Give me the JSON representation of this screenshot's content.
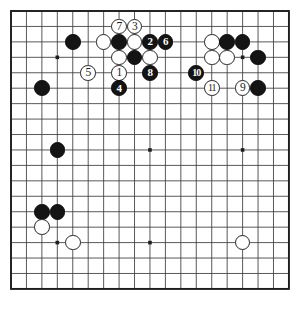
{
  "diagram": {
    "type": "go-board-diagram",
    "board_size": 19,
    "colors": {
      "background": "#ffffff",
      "grid_line": "#3c3c3c",
      "border_line": "#1e1e1e",
      "black_stone": "#141414",
      "white_stone": "#ffffff",
      "white_stone_outline": "#262626",
      "star_point": "#1e1e1e"
    },
    "geometry": {
      "origin_x": 11,
      "origin_y": 11,
      "spacing": 15.44,
      "stone_diameter": 15.6
    },
    "star_points": [
      {
        "col": 3,
        "row": 3
      },
      {
        "col": 9,
        "row": 3
      },
      {
        "col": 15,
        "row": 3
      },
      {
        "col": 3,
        "row": 9
      },
      {
        "col": 9,
        "row": 9
      },
      {
        "col": 15,
        "row": 9
      },
      {
        "col": 3,
        "row": 15
      },
      {
        "col": 9,
        "row": 15
      },
      {
        "col": 15,
        "row": 15
      }
    ],
    "stones": [
      {
        "id": "b-pre-1",
        "color": "black",
        "label": "",
        "col": 4,
        "row": 2
      },
      {
        "id": "w-pre-1",
        "color": "white",
        "label": "",
        "col": 6,
        "row": 2
      },
      {
        "id": "b-pre-2",
        "color": "black",
        "label": "",
        "col": 7,
        "row": 2
      },
      {
        "id": "w-pre-2",
        "color": "white",
        "label": "",
        "col": 8,
        "row": 2
      },
      {
        "id": "w-pre-3",
        "color": "white",
        "label": "",
        "col": 7,
        "row": 3
      },
      {
        "id": "b-pre-3",
        "color": "black",
        "label": "",
        "col": 8,
        "row": 3
      },
      {
        "id": "w-pre-4",
        "color": "white",
        "label": "",
        "col": 9,
        "row": 3
      },
      {
        "id": "b-pre-4",
        "color": "black",
        "label": "",
        "col": 2,
        "row": 5
      },
      {
        "id": "w-pre-5",
        "color": "white",
        "label": "",
        "col": 13,
        "row": 2
      },
      {
        "id": "b-pre-5",
        "color": "black",
        "label": "",
        "col": 14,
        "row": 2
      },
      {
        "id": "b-pre-6",
        "color": "black",
        "label": "",
        "col": 15,
        "row": 2
      },
      {
        "id": "w-pre-6",
        "color": "white",
        "label": "",
        "col": 13,
        "row": 3
      },
      {
        "id": "w-pre-7",
        "color": "white",
        "label": "",
        "col": 14,
        "row": 3
      },
      {
        "id": "b-pre-7",
        "color": "black",
        "label": "",
        "col": 16,
        "row": 3
      },
      {
        "id": "b-pre-8",
        "color": "black",
        "label": "",
        "col": 16,
        "row": 5
      },
      {
        "id": "b-pre-9",
        "color": "black",
        "label": "",
        "col": 3,
        "row": 9
      },
      {
        "id": "b-pre-10",
        "color": "black",
        "label": "",
        "col": 2,
        "row": 13
      },
      {
        "id": "b-pre-11",
        "color": "black",
        "label": "",
        "col": 3,
        "row": 13
      },
      {
        "id": "w-pre-8",
        "color": "white",
        "label": "",
        "col": 2,
        "row": 14
      },
      {
        "id": "w-pre-9",
        "color": "white",
        "label": "",
        "col": 4,
        "row": 15
      },
      {
        "id": "w-pre-10",
        "color": "white",
        "label": "",
        "col": 15,
        "row": 15
      },
      {
        "id": "move-1",
        "color": "white",
        "label": "1",
        "col": 7,
        "row": 4
      },
      {
        "id": "move-2",
        "color": "black",
        "label": "2",
        "col": 9,
        "row": 2
      },
      {
        "id": "move-3",
        "color": "white",
        "label": "3",
        "col": 8,
        "row": 1
      },
      {
        "id": "move-4",
        "color": "black",
        "label": "4",
        "col": 7,
        "row": 5
      },
      {
        "id": "move-5",
        "color": "white",
        "label": "5",
        "col": 5,
        "row": 4
      },
      {
        "id": "move-6",
        "color": "black",
        "label": "6",
        "col": 10,
        "row": 2
      },
      {
        "id": "move-7",
        "color": "white",
        "label": "7",
        "col": 7,
        "row": 1
      },
      {
        "id": "move-8",
        "color": "black",
        "label": "8",
        "col": 9,
        "row": 4
      },
      {
        "id": "move-9",
        "color": "white",
        "label": "9",
        "col": 15,
        "row": 5
      },
      {
        "id": "move-10",
        "color": "black",
        "label": "10",
        "col": 12,
        "row": 4
      },
      {
        "id": "move-11",
        "color": "white",
        "label": "11",
        "col": 13,
        "row": 5
      }
    ]
  }
}
